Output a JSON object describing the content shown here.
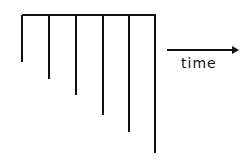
{
  "diagram": {
    "time_label": "time",
    "colors": {
      "stroke": "#111111",
      "background": "#ffffff"
    },
    "top_bar": {
      "x1": 22,
      "x2": 155,
      "y": 15
    },
    "lines": [
      {
        "x": 22,
        "y_end": 62
      },
      {
        "x": 49,
        "y_end": 79
      },
      {
        "x": 76,
        "y_end": 95
      },
      {
        "x": 103,
        "y_end": 115
      },
      {
        "x": 129,
        "y_end": 132
      },
      {
        "x": 155,
        "y_end": 153
      }
    ],
    "arrow": {
      "x1": 167,
      "x2": 239,
      "y": 50,
      "direction": "right"
    }
  }
}
